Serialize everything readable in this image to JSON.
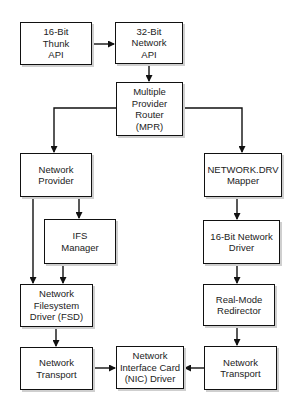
{
  "diagram": {
    "nodes": [
      {
        "id": "thunk",
        "label": "16-Bit\nThunk\nAPI"
      },
      {
        "id": "net32",
        "label": "32-Bit\nNetwork\nAPI"
      },
      {
        "id": "mpr",
        "label": "Multiple\nProvider\nRouter\n(MPR)"
      },
      {
        "id": "np",
        "label": "Network\nProvider"
      },
      {
        "id": "ndrv",
        "label": "NETWORK.DRV\nMapper"
      },
      {
        "id": "ifs",
        "label": "IFS\nManager"
      },
      {
        "id": "nd16",
        "label": "16-Bit Network\nDriver"
      },
      {
        "id": "fsd",
        "label": "Network\nFilesystem\nDriver (FSD)"
      },
      {
        "id": "rmr",
        "label": "Real-Mode\nRedirector"
      },
      {
        "id": "ntl",
        "label": "Network\nTransport"
      },
      {
        "id": "nic",
        "label": "Network\nInterface Card\n(NIC) Driver"
      },
      {
        "id": "ntr",
        "label": "Network\nTransport"
      }
    ],
    "edges": [
      {
        "from": "thunk",
        "to": "net32"
      },
      {
        "from": "net32",
        "to": "mpr"
      },
      {
        "from": "mpr",
        "to": "np"
      },
      {
        "from": "mpr",
        "to": "ndrv"
      },
      {
        "from": "np",
        "to": "ifs"
      },
      {
        "from": "np",
        "to": "fsd"
      },
      {
        "from": "ifs",
        "to": "fsd"
      },
      {
        "from": "fsd",
        "to": "ntl"
      },
      {
        "from": "ntl",
        "to": "nic"
      },
      {
        "from": "ndrv",
        "to": "nd16"
      },
      {
        "from": "nd16",
        "to": "rmr"
      },
      {
        "from": "rmr",
        "to": "ntr"
      },
      {
        "from": "ntr",
        "to": "nic"
      }
    ]
  }
}
